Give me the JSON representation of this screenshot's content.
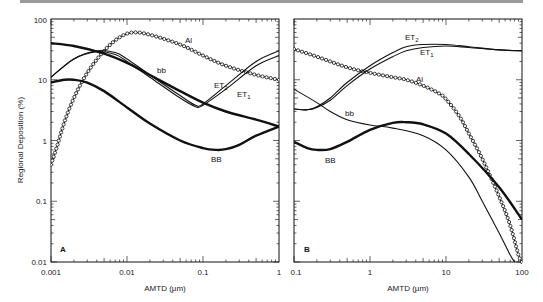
{
  "chart_data": [
    {
      "panel": "A",
      "type": "line",
      "title": "",
      "xlabel": "AMTD (µm)",
      "ylabel": "Regional Deposition (%)",
      "xscale": "log",
      "yscale": "log",
      "xlim": [
        0.001,
        1
      ],
      "ylim": [
        0.01,
        100
      ],
      "xticks": [
        "0.001",
        "0.01",
        "0.1",
        "1"
      ],
      "yticks": [
        "0.01",
        "0.1",
        "1",
        "10",
        "100"
      ],
      "panel_label": "A",
      "grid": false,
      "series": [
        {
          "name": "Al",
          "style": "thin-with-circles",
          "x": [
            0.001,
            0.0012,
            0.0015,
            0.002,
            0.003,
            0.005,
            0.008,
            0.012,
            0.02,
            0.05,
            0.1,
            0.2,
            0.5,
            1
          ],
          "y": [
            0.4,
            0.8,
            2,
            5,
            13,
            30,
            50,
            60,
            55,
            38,
            25,
            17,
            12,
            10
          ]
        },
        {
          "name": "bb",
          "style": "thick",
          "x": [
            0.001,
            0.002,
            0.005,
            0.01,
            0.02,
            0.05,
            0.1,
            0.2,
            0.5,
            1
          ],
          "y": [
            40,
            36,
            27,
            19,
            12,
            6.5,
            4.2,
            3,
            2.2,
            1.7
          ]
        },
        {
          "name": "ET1",
          "style": "thin",
          "x": [
            0.001,
            0.002,
            0.004,
            0.007,
            0.01,
            0.02,
            0.05,
            0.08,
            0.1,
            0.2,
            0.5,
            1
          ],
          "y": [
            11,
            22,
            29,
            26,
            20,
            11,
            5,
            3.6,
            3.8,
            7,
            17,
            25
          ]
        },
        {
          "name": "ET2",
          "style": "thin",
          "x": [
            0.001,
            0.002,
            0.004,
            0.007,
            0.01,
            0.02,
            0.05,
            0.08,
            0.1,
            0.2,
            0.5,
            1
          ],
          "y": [
            11,
            22,
            30,
            28,
            22,
            12,
            5.5,
            3.8,
            4,
            8,
            20,
            30
          ]
        },
        {
          "name": "BB",
          "style": "thick",
          "x": [
            0.001,
            0.0015,
            0.002,
            0.003,
            0.005,
            0.01,
            0.02,
            0.05,
            0.1,
            0.15,
            0.2,
            0.3,
            0.5,
            1
          ],
          "y": [
            9,
            10,
            10,
            9,
            6.5,
            3.5,
            1.9,
            1.0,
            0.75,
            0.7,
            0.72,
            0.85,
            1.2,
            1.7
          ]
        }
      ]
    },
    {
      "panel": "B",
      "type": "line",
      "title": "",
      "xlabel": "AMTD (µm)",
      "ylabel": "",
      "xscale": "log",
      "yscale": "log",
      "xlim": [
        0.1,
        100
      ],
      "ylim": [
        0.01,
        100
      ],
      "xticks": [
        "0.1",
        "1",
        "10",
        "100"
      ],
      "panel_label": "B",
      "grid": false,
      "series": [
        {
          "name": "Al",
          "style": "thin-with-circles",
          "x": [
            0.1,
            0.2,
            0.5,
            1,
            2,
            3,
            5,
            8,
            10,
            15,
            20,
            30,
            50,
            70,
            90,
            100
          ],
          "y": [
            32,
            24,
            16,
            13,
            11,
            10,
            8,
            6,
            4.8,
            2.5,
            1.3,
            0.5,
            0.12,
            0.04,
            0.013,
            0.01
          ]
        },
        {
          "name": "ET2",
          "style": "thin",
          "x": [
            0.1,
            0.15,
            0.2,
            0.3,
            0.5,
            1,
            2,
            3,
            5,
            10,
            20,
            50,
            100
          ],
          "y": [
            3.3,
            3.2,
            3.6,
            5,
            9,
            17,
            28,
            35,
            38,
            38,
            35,
            31,
            30
          ]
        },
        {
          "name": "ET1",
          "style": "thin",
          "x": [
            0.1,
            0.15,
            0.2,
            0.3,
            0.5,
            1,
            2,
            3,
            5,
            10,
            20,
            50,
            100
          ],
          "y": [
            3.3,
            3.2,
            3.5,
            4.6,
            8,
            15,
            24,
            30,
            34,
            36,
            34,
            31,
            30
          ]
        },
        {
          "name": "bb",
          "style": "thin",
          "x": [
            0.1,
            0.2,
            0.3,
            0.5,
            1,
            2,
            5,
            10,
            20,
            30,
            50,
            70,
            80
          ],
          "y": [
            7,
            4.2,
            3,
            2.2,
            1.8,
            1.6,
            1.2,
            0.7,
            0.25,
            0.1,
            0.03,
            0.013,
            0.01
          ]
        },
        {
          "name": "BB",
          "style": "thick",
          "x": [
            0.1,
            0.15,
            0.2,
            0.3,
            0.5,
            1,
            2,
            3,
            5,
            10,
            20,
            50,
            100
          ],
          "y": [
            0.95,
            0.75,
            0.7,
            0.72,
            0.95,
            1.5,
            1.95,
            2.0,
            1.85,
            1.3,
            0.6,
            0.17,
            0.05
          ]
        }
      ]
    }
  ],
  "labels": {
    "xlabel_a": "AMTD (µm)",
    "xlabel_b": "AMTD (µm)",
    "ylabel": "Regional Deposition (%)",
    "panel_a": "A",
    "panel_b": "B",
    "a_xticks": [
      "0.001",
      "0.01",
      "0.1",
      "1"
    ],
    "b_xticks": [
      "0.1",
      "1",
      "10",
      "100"
    ],
    "yticks": [
      "100",
      "10",
      "1",
      "0.1",
      "0.01"
    ],
    "a_curve_labels": {
      "al": "Al",
      "bb": "bb",
      "et2": "ET",
      "et2_sub": "2",
      "et1": "ET",
      "et1_sub": "1",
      "BB": "BB"
    },
    "b_curve_labels": {
      "al": "Al",
      "bb": "bb",
      "et2": "ET",
      "et2_sub": "2",
      "et1": "ET",
      "et1_sub": "1",
      "BB": "BB"
    }
  }
}
